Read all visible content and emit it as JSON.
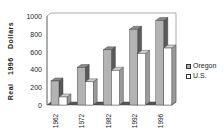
{
  "chart_data": {
    "type": "bar",
    "title": "",
    "xlabel": "",
    "ylabel": "Real 1996 Dollars",
    "categories": [
      "1962",
      "1972",
      "1982",
      "1992",
      "1996"
    ],
    "series": [
      {
        "name": "Oregon",
        "values": [
          270,
          420,
          620,
          850,
          950
        ],
        "color": "#b3b3b3"
      },
      {
        "name": "U.S.",
        "values": [
          90,
          260,
          390,
          580,
          640
        ],
        "color": "#ffffff"
      }
    ],
    "ylim": [
      0,
      1000
    ],
    "yticks": [
      "0",
      "200",
      "400",
      "600",
      "800",
      "1000"
    ],
    "grid": false,
    "legend_position": "right",
    "style": "3d-clustered-column"
  },
  "legend": {
    "items": [
      {
        "label": "Oregon",
        "color": "#b3b3b3"
      },
      {
        "label": "U.S.",
        "color": "#ffffff"
      }
    ]
  },
  "axis": {
    "ylabel": "Real 1996 Dollars",
    "yticks": [
      "0",
      "200",
      "400",
      "600",
      "800",
      "1000"
    ],
    "xticks": [
      "1962",
      "1972",
      "1982",
      "1992",
      "1996"
    ]
  }
}
